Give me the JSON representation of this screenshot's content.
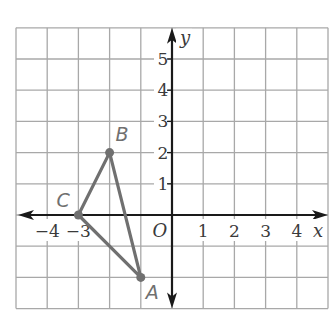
{
  "chart_data": {
    "type": "scatter",
    "title": "",
    "xlabel": "x",
    "ylabel": "y",
    "origin_label": "O",
    "xlim": [
      -5,
      5
    ],
    "ylim": [
      -3,
      6
    ],
    "grid": true,
    "x_ticks": [
      -4,
      -3,
      1,
      2,
      3,
      4
    ],
    "y_ticks": [
      1,
      2,
      3,
      4,
      5
    ],
    "x_tick_labels": [
      "−4",
      "−3",
      "1",
      "2",
      "3",
      "4"
    ],
    "y_tick_labels": [
      "1",
      "2",
      "3",
      "4",
      "5"
    ],
    "points": [
      {
        "label": "A",
        "x": -1,
        "y": -2
      },
      {
        "label": "B",
        "x": -2,
        "y": 2
      },
      {
        "label": "C",
        "x": -3,
        "y": 0
      }
    ],
    "polygon": [
      "A",
      "B",
      "C"
    ],
    "colors": {
      "grid": "#a8a8a8",
      "axis": "#1a1a1a",
      "triangle": "#707070",
      "point_label": "#707070"
    }
  }
}
